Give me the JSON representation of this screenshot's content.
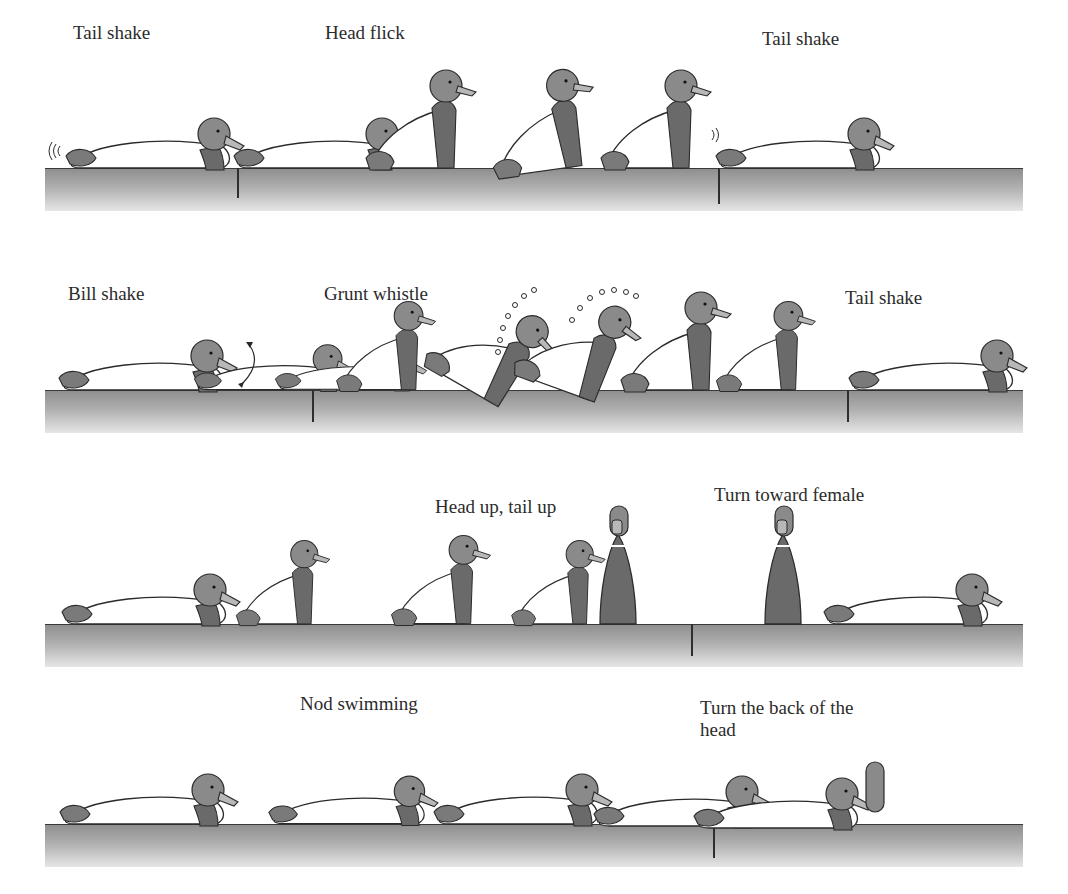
{
  "figure": {
    "rows": [
      {
        "id": "row-1",
        "labels": [
          {
            "text": "Tail shake",
            "x": 73,
            "y": 22
          },
          {
            "text": "Head flick",
            "x": 325,
            "y": 22
          },
          {
            "text": "Tail shake",
            "x": 762,
            "y": 28
          }
        ],
        "water": {
          "x": 45,
          "y": 168,
          "width": 978
        },
        "dividers": [
          237,
          718
        ]
      },
      {
        "id": "row-2",
        "labels": [
          {
            "text": "Bill shake",
            "x": 68,
            "y": 283
          },
          {
            "text": "Grunt whistle",
            "x": 324,
            "y": 283
          },
          {
            "text": "Tail shake",
            "x": 845,
            "y": 287
          }
        ],
        "water": {
          "x": 45,
          "y": 390,
          "width": 978
        },
        "dividers": [
          312,
          847
        ]
      },
      {
        "id": "row-3",
        "labels": [
          {
            "text": "Head up, tail up",
            "x": 435,
            "y": 496
          },
          {
            "text": "Turn toward female",
            "x": 714,
            "y": 484
          }
        ],
        "water": {
          "x": 45,
          "y": 624,
          "width": 978
        },
        "dividers": [
          691
        ]
      },
      {
        "id": "row-4",
        "labels": [
          {
            "text": "Nod swimming",
            "x": 300,
            "y": 693
          },
          {
            "text": "Turn the back of the head",
            "x": 700,
            "y": 697
          }
        ],
        "water": {
          "x": 45,
          "y": 824,
          "width": 978
        },
        "dividers": [
          713
        ]
      }
    ],
    "colors": {
      "head": "#8a8a8a",
      "neck": "#6a6a6a",
      "bill": "#b8b8b8",
      "body": "#ffffff",
      "outline": "#2b2b2b",
      "tail": "#7a7a7a"
    }
  }
}
